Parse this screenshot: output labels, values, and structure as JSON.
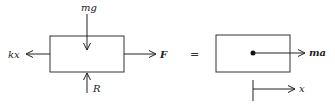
{
  "diagram": {
    "type": "free-body-diagram",
    "left": {
      "forces": {
        "top": "mg",
        "left": "kx",
        "right": "F",
        "bottom": "R"
      }
    },
    "equals": "=",
    "right": {
      "result_label": "ma",
      "axis_label": "x"
    }
  }
}
